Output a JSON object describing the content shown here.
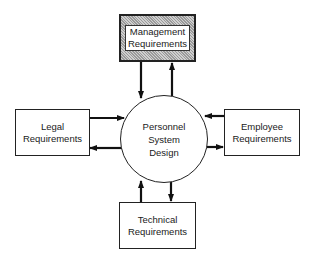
{
  "diagram": {
    "center": {
      "lines": [
        "Personnel",
        "System",
        "Design"
      ]
    },
    "nodes": {
      "management": {
        "lines": [
          "Management",
          "Requirements"
        ],
        "highlighted": true
      },
      "legal": {
        "lines": [
          "Legal",
          "Requirements"
        ]
      },
      "employee": {
        "lines": [
          "Employee",
          "Requirements"
        ]
      },
      "technical": {
        "lines": [
          "Technical",
          "Requirements"
        ]
      }
    },
    "edges": [
      {
        "from": "management",
        "to": "center"
      },
      {
        "from": "center",
        "to": "management"
      },
      {
        "from": "legal",
        "to": "center"
      },
      {
        "from": "center",
        "to": "legal"
      },
      {
        "from": "employee",
        "to": "center"
      },
      {
        "from": "center",
        "to": "employee"
      },
      {
        "from": "technical",
        "to": "center"
      },
      {
        "from": "center",
        "to": "technical"
      }
    ]
  }
}
